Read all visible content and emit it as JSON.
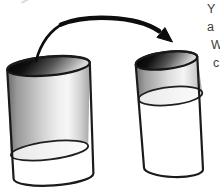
{
  "figure": {
    "name": "liquid-pouring-between-glasses",
    "left_glass": "wider glass, liquid level low",
    "right_glass": "narrower glass, liquid level high",
    "arrow": "curved arrow pointing from left glass to right glass"
  },
  "edge_text": {
    "lines": [
      "Y",
      "a",
      "W",
      "c"
    ]
  },
  "colors": {
    "background": "#ffffff",
    "ink": "#1b1b1b",
    "glass_dark": "#6a6a6a",
    "glass_light": "#f6f6f6",
    "rim_dark": "#000000",
    "liquid_surface": "#f0f0f0"
  }
}
